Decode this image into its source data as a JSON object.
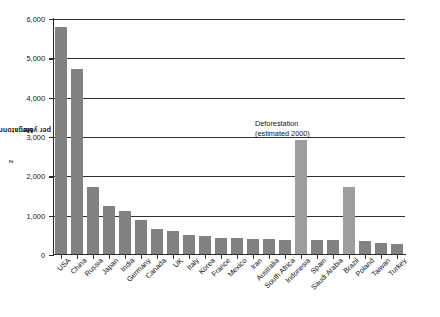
{
  "chart_data": {
    "type": "bar",
    "title": "",
    "xlabel": "",
    "ylabel": "Megatonnes of CO2 per year",
    "ylabel_prefix": "Megatonnes of CO",
    "ylabel_sub": "2",
    "ylabel_suffix": " per year",
    "ylim": [
      0,
      6000
    ],
    "grid": true,
    "legend": false,
    "ytick_labels": [
      "6,000",
      "5,000",
      "4,000",
      "3,000",
      "2,000",
      "1,000",
      "0"
    ],
    "ytick_values": [
      6000,
      5000,
      4000,
      3000,
      2000,
      1000,
      0
    ],
    "categories": [
      "USA",
      "China",
      "Russia",
      "Japan",
      "India",
      "Germany",
      "Canada",
      "UK",
      "Italy",
      "Korea",
      "France",
      "Mexico",
      "Iran",
      "Australia",
      "South Africa",
      "Indonesia",
      "Spain",
      "Saudi Arabia",
      "Brazil",
      "Poland",
      "Taiwan",
      "Turkey"
    ],
    "values": [
      5800,
      4720,
      1700,
      1230,
      1110,
      860,
      630,
      580,
      490,
      470,
      420,
      400,
      390,
      380,
      370,
      2900,
      360,
      355,
      1700,
      320,
      290,
      250
    ],
    "highlight_categories": [
      "Indonesia",
      "Brazil"
    ],
    "annotations": [
      {
        "line1": "Deforestation",
        "line2": "(estimated 2000)",
        "target": "Indonesia"
      }
    ],
    "colors": {
      "bar": "#828282",
      "bar_highlight": "#9d9d9d",
      "axis": "#2a2a2a",
      "gridline": "#30302f",
      "text": "#141414",
      "background": "#ffffff"
    }
  }
}
